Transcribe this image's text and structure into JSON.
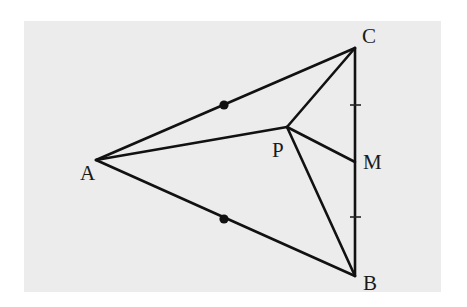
{
  "diagram": {
    "background": {
      "x": 24,
      "y": 21,
      "width": 417,
      "height": 271,
      "color": "#ececec"
    },
    "points": {
      "A": {
        "x": 96,
        "y": 160,
        "label": "A",
        "lx": 80,
        "ly": 180
      },
      "B": {
        "x": 355,
        "y": 276,
        "label": "B",
        "lx": 363,
        "ly": 290
      },
      "C": {
        "x": 355,
        "y": 48,
        "label": "C",
        "lx": 362,
        "ly": 43
      },
      "P": {
        "x": 287,
        "y": 127,
        "label": "P",
        "lx": 272,
        "ly": 157
      },
      "M": {
        "x": 355,
        "y": 162,
        "label": "M",
        "lx": 363,
        "ly": 169
      }
    },
    "segments": [
      {
        "from": "A",
        "to": "C"
      },
      {
        "from": "A",
        "to": "B"
      },
      {
        "from": "C",
        "to": "B"
      },
      {
        "from": "A",
        "to": "P"
      },
      {
        "from": "P",
        "to": "C"
      },
      {
        "from": "P",
        "to": "M"
      },
      {
        "from": "P",
        "to": "B"
      }
    ],
    "equal_length_marks": {
      "dots": [
        {
          "on": "AC",
          "x": 224,
          "y": 105
        },
        {
          "on": "AB",
          "x": 224,
          "y": 219
        }
      ],
      "ticks": [
        {
          "on": "CM",
          "x1": 350,
          "x2": 361,
          "y": 105
        },
        {
          "on": "MB",
          "x1": 350,
          "x2": 361,
          "y": 217
        }
      ]
    },
    "colors": {
      "line": "#111111",
      "label": "#1a1a1a",
      "background": "#ececec"
    }
  }
}
